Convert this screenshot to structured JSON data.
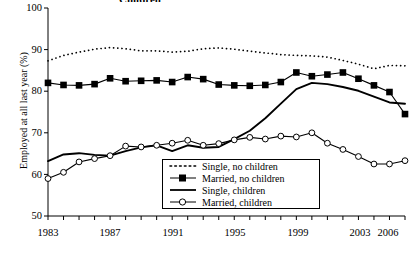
{
  "chart_title": "Children",
  "axes": {
    "ylabel": "Employed at all last year (%)",
    "xlabel": "",
    "ylim": [
      50,
      100
    ],
    "xlim": [
      1983,
      2006
    ],
    "yticks": [
      "100",
      "90",
      "80",
      "70",
      "60",
      "50"
    ],
    "xticks": [
      "1983",
      "1987",
      "1991",
      "1995",
      "1999",
      "2003",
      "2006"
    ],
    "grid": false
  },
  "legend": {
    "position": "bottom-center",
    "entries": [
      {
        "label": "Single, no children",
        "marker": "dotted-line",
        "color": "#000000"
      },
      {
        "label": "Married, no children",
        "marker": "filled-square",
        "color": "#000000"
      },
      {
        "label": "Single, children",
        "marker": "solid-line",
        "color": "#000000"
      },
      {
        "label": "Married, children",
        "marker": "open-circle",
        "color": "#000000"
      }
    ]
  },
  "chart_data": {
    "type": "line",
    "title": "Children",
    "xlabel": "",
    "ylabel": "Employed at all last year (%)",
    "xlim": [
      1983,
      2006
    ],
    "ylim": [
      50,
      100
    ],
    "grid": false,
    "legend_position": "bottom-center",
    "x": [
      1983,
      1984,
      1985,
      1986,
      1987,
      1988,
      1989,
      1990,
      1991,
      1992,
      1993,
      1994,
      1995,
      1996,
      1997,
      1998,
      1999,
      2000,
      2001,
      2002,
      2003,
      2004,
      2005,
      2006
    ],
    "series": [
      {
        "name": "Single, no children",
        "style": "dotted",
        "marker": "none",
        "values": [
          87.3,
          88.6,
          89.4,
          90.1,
          90.5,
          90.2,
          89.7,
          89.7,
          89.4,
          89.6,
          90.2,
          90.4,
          90.1,
          89.6,
          89.2,
          88.8,
          88.6,
          88.5,
          88.2,
          87.4,
          86.5,
          85.4,
          86.2,
          86.1
        ]
      },
      {
        "name": "Married, no children",
        "style": "solid",
        "marker": "filled-square",
        "values": [
          82.0,
          81.5,
          81.4,
          81.7,
          83.1,
          82.4,
          82.5,
          82.6,
          82.2,
          83.4,
          82.9,
          81.6,
          81.4,
          81.3,
          81.5,
          82.2,
          84.5,
          83.6,
          84.0,
          84.5,
          83.0,
          81.4,
          79.8,
          74.5
        ]
      },
      {
        "name": "Single, children",
        "style": "solid",
        "marker": "none",
        "values": [
          63.2,
          64.8,
          65.1,
          64.7,
          64.5,
          65.6,
          66.5,
          67.0,
          65.6,
          67.0,
          66.4,
          66.6,
          68.5,
          70.5,
          73.5,
          77.0,
          80.5,
          82.0,
          81.7,
          81.0,
          80.1,
          78.7,
          77.3,
          77.0
        ]
      },
      {
        "name": "Married, children",
        "style": "solid",
        "marker": "open-circle",
        "values": [
          59.0,
          60.5,
          63.0,
          63.8,
          64.5,
          66.8,
          66.6,
          67.0,
          67.5,
          68.2,
          67.0,
          67.4,
          68.3,
          68.9,
          68.5,
          69.2,
          69.0,
          70.0,
          67.5,
          66.0,
          64.3,
          62.5,
          62.5,
          63.3
        ]
      }
    ]
  }
}
